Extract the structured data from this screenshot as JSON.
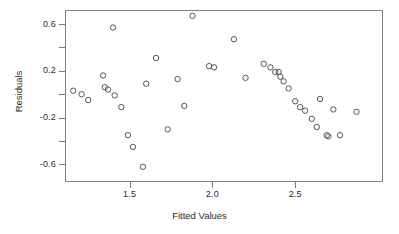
{
  "chart_data": {
    "type": "scatter",
    "title": "",
    "xlabel": "Fitted Values",
    "ylabel": "Residuals",
    "xlim": [
      1.11,
      3.03
    ],
    "ylim": [
      -0.75,
      0.72
    ],
    "grid": false,
    "legend": null,
    "marker": "open-circle",
    "marker_color": "#555555",
    "xticks": [
      1.5,
      2.0,
      2.5
    ],
    "xtick_labels": [
      "1.5",
      "2.0",
      "2.5"
    ],
    "yticks": [
      -0.6,
      -0.4,
      -0.2,
      0.0,
      0.2,
      0.4,
      0.6
    ],
    "ytick_labels": [
      "-0.6",
      "",
      "-0.2",
      "",
      "0.2",
      "",
      "0.6"
    ],
    "ytick_labeled": [
      -0.6,
      -0.2,
      0.2,
      0.6
    ],
    "n_points": 40,
    "x": [
      1.16,
      1.21,
      1.25,
      1.34,
      1.35,
      1.37,
      1.4,
      1.41,
      1.45,
      1.49,
      1.52,
      1.58,
      1.6,
      1.66,
      1.73,
      1.79,
      1.83,
      1.88,
      1.98,
      2.01,
      2.13,
      2.2,
      2.31,
      2.35,
      2.38,
      2.4,
      2.41,
      2.43,
      2.46,
      2.5,
      2.53,
      2.56,
      2.6,
      2.63,
      2.65,
      2.69,
      2.7,
      2.73,
      2.77,
      2.87
    ],
    "y": [
      0.03,
      0.0,
      -0.05,
      0.16,
      0.06,
      0.04,
      0.57,
      -0.01,
      -0.11,
      -0.35,
      -0.45,
      -0.62,
      0.09,
      0.31,
      -0.3,
      0.13,
      -0.1,
      0.67,
      0.24,
      0.23,
      0.47,
      0.14,
      0.26,
      0.23,
      0.19,
      0.19,
      0.15,
      0.11,
      0.05,
      -0.06,
      -0.11,
      -0.14,
      -0.21,
      -0.28,
      -0.04,
      -0.35,
      -0.36,
      -0.13,
      -0.35,
      -0.15
    ]
  },
  "axes": {
    "y_title": "Residuals",
    "x_title": "Fitted Values"
  }
}
